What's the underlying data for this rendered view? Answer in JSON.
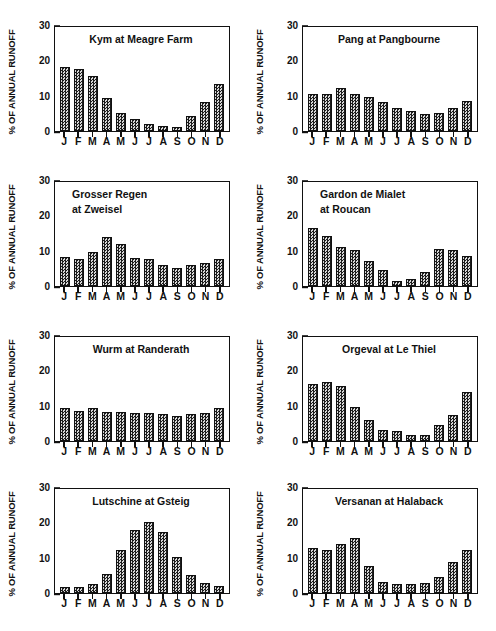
{
  "figure": {
    "y_axis_title": "% OF ANNUAL RUNOFF",
    "y_ticks_major": [
      "0",
      "10",
      "20",
      "30"
    ],
    "y_ticks_minor": [
      5,
      15,
      25
    ],
    "y_range": [
      0,
      30
    ],
    "months": [
      "J",
      "F",
      "M",
      "A",
      "M",
      "J",
      "J",
      "A",
      "S",
      "O",
      "N",
      "D"
    ],
    "bar_fill_color": "#6e6e6e",
    "bar_edge_color": "#111111",
    "axis_color": "#111111",
    "background_color": "#ffffff"
  },
  "chart_data": [
    {
      "type": "bar",
      "title": "Kym at Meagre Farm",
      "title_lines": [
        "Kym at Meagre Farm"
      ],
      "title_align": "center",
      "xlabel": "",
      "ylabel": "% OF ANNUAL RUNOFF",
      "categories": [
        "J",
        "F",
        "M",
        "A",
        "M",
        "J",
        "J",
        "A",
        "S",
        "O",
        "N",
        "D"
      ],
      "values": [
        18.4,
        17.9,
        16.0,
        9.5,
        5.1,
        3.4,
        2.1,
        1.4,
        1.1,
        4.4,
        8.3,
        13.7
      ],
      "ylim": [
        0,
        30
      ],
      "grid": false,
      "legend": "none"
    },
    {
      "type": "bar",
      "title": "Pang at Pangbourne",
      "title_lines": [
        "Pang at Pangbourne"
      ],
      "title_align": "center",
      "xlabel": "",
      "ylabel": "% OF ANNUAL RUNOFF",
      "categories": [
        "J",
        "F",
        "M",
        "A",
        "M",
        "J",
        "J",
        "A",
        "S",
        "O",
        "N",
        "D"
      ],
      "values": [
        10.7,
        10.7,
        12.5,
        10.7,
        9.7,
        8.4,
        6.5,
        5.8,
        4.9,
        5.2,
        6.5,
        8.8
      ],
      "ylim": [
        0,
        30
      ],
      "grid": false,
      "legend": "none"
    },
    {
      "type": "bar",
      "title": "Grosser Regen at Zweisel",
      "title_lines": [
        "Grosser Regen",
        "at Zweisel"
      ],
      "title_align": "left",
      "xlabel": "",
      "ylabel": "% OF ANNUAL RUNOFF",
      "categories": [
        "J",
        "F",
        "M",
        "A",
        "M",
        "J",
        "J",
        "A",
        "S",
        "O",
        "N",
        "D"
      ],
      "values": [
        8.4,
        7.7,
        9.8,
        14.2,
        12.0,
        8.0,
        7.7,
        6.2,
        5.3,
        6.2,
        6.6,
        7.8
      ],
      "ylim": [
        0,
        30
      ],
      "grid": false,
      "legend": "none"
    },
    {
      "type": "bar",
      "title": "Gardon de Mialet at Roucan",
      "title_lines": [
        "Gardon de Mialet",
        "at Roucan"
      ],
      "title_align": "left",
      "xlabel": "",
      "ylabel": "% OF ANNUAL RUNOFF",
      "categories": [
        "J",
        "F",
        "M",
        "A",
        "M",
        "J",
        "J",
        "A",
        "S",
        "O",
        "N",
        "D"
      ],
      "values": [
        16.7,
        14.4,
        11.3,
        10.3,
        7.2,
        4.7,
        1.4,
        2.0,
        3.9,
        10.7,
        10.3,
        8.7
      ],
      "ylim": [
        0,
        30
      ],
      "grid": false,
      "legend": "none"
    },
    {
      "type": "bar",
      "title": "Wurm at Randerath",
      "title_lines": [
        "Wurm at Randerath"
      ],
      "title_align": "center",
      "xlabel": "",
      "ylabel": "% OF ANNUAL RUNOFF",
      "categories": [
        "J",
        "F",
        "M",
        "A",
        "M",
        "J",
        "J",
        "A",
        "S",
        "O",
        "N",
        "D"
      ],
      "values": [
        9.4,
        8.7,
        9.4,
        8.5,
        8.5,
        8.1,
        8.2,
        7.8,
        7.1,
        7.8,
        8.1,
        9.4
      ],
      "ylim": [
        0,
        30
      ],
      "grid": false,
      "legend": "none"
    },
    {
      "type": "bar",
      "title": "Orgeval at Le Thiel",
      "title_lines": [
        "Orgeval at Le Thiel"
      ],
      "title_align": "center",
      "xlabel": "",
      "ylabel": "% OF ANNUAL RUNOFF",
      "categories": [
        "J",
        "F",
        "M",
        "A",
        "M",
        "J",
        "J",
        "A",
        "S",
        "O",
        "N",
        "D"
      ],
      "values": [
        16.5,
        17.0,
        16.0,
        9.7,
        6.2,
        3.2,
        3.0,
        1.7,
        1.7,
        4.6,
        7.4,
        14.2
      ],
      "ylim": [
        0,
        30
      ],
      "grid": false,
      "legend": "none"
    },
    {
      "type": "bar",
      "title": "Lutschine at Gsteig",
      "title_lines": [
        "Lutschine at Gsteig"
      ],
      "title_align": "center",
      "xlabel": "",
      "ylabel": "% OF ANNUAL RUNOFF",
      "categories": [
        "J",
        "F",
        "M",
        "A",
        "M",
        "J",
        "J",
        "A",
        "S",
        "O",
        "N",
        "D"
      ],
      "values": [
        1.7,
        1.7,
        2.5,
        5.6,
        12.3,
        18.1,
        20.4,
        17.7,
        10.4,
        5.2,
        2.9,
        2.1
      ],
      "ylim": [
        0,
        30
      ],
      "grid": false,
      "legend": "none"
    },
    {
      "type": "bar",
      "title": "Versanan at Halaback",
      "title_lines": [
        "Versanan at Halaback"
      ],
      "title_align": "center",
      "xlabel": "",
      "ylabel": "% OF ANNUAL RUNOFF",
      "categories": [
        "J",
        "F",
        "M",
        "A",
        "M",
        "J",
        "J",
        "A",
        "S",
        "O",
        "N",
        "D"
      ],
      "values": [
        13.0,
        12.3,
        14.0,
        16.0,
        7.7,
        3.1,
        2.5,
        2.5,
        2.8,
        4.7,
        9.0,
        12.3
      ],
      "ylim": [
        0,
        30
      ],
      "grid": false,
      "legend": "none"
    }
  ]
}
